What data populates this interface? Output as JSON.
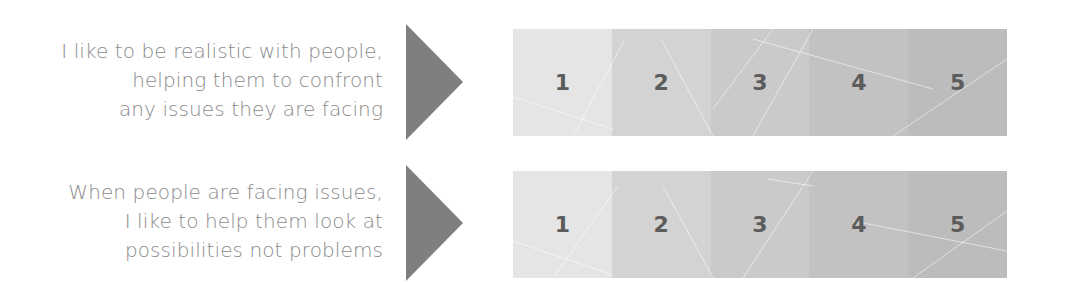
{
  "colors": {
    "text": "#8a8a8a",
    "arrow": "#7f7f7f",
    "number": "#5c5c5c",
    "cells": [
      "#e5e5e5",
      "#d3d3d3",
      "#cacaca",
      "#c2c2c2",
      "#bcbcbc"
    ]
  },
  "items": [
    {
      "statement_lines": [
        "I like to be realistic with people,",
        "helping them to confront",
        "any issues they are facing"
      ],
      "scale": [
        "1",
        "2",
        "3",
        "4",
        "5"
      ]
    },
    {
      "statement_lines": [
        "When people are facing issues,",
        "I like to help them look at",
        "possibilities not problems"
      ],
      "scale": [
        "1",
        "2",
        "3",
        "4",
        "5"
      ]
    }
  ]
}
